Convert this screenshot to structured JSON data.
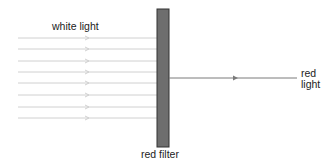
{
  "diagram": {
    "labels": {
      "input": "white light",
      "filter": "red filter",
      "output_line1": "red",
      "output_line2": "light"
    },
    "input_rays": {
      "count": 8,
      "y": [
        38,
        49,
        61,
        72,
        83,
        95,
        107,
        118
      ],
      "x_start": 18,
      "x_end": 157,
      "arrow_x": 88,
      "color": "#d0d0d0"
    },
    "filter": {
      "x": 157,
      "y": 9,
      "width": 12,
      "height": 138,
      "fill": "#6e6e6e",
      "stroke": "#333333"
    },
    "output_ray": {
      "y": 78,
      "x_start": 169,
      "x_end": 297,
      "arrow_x": 237,
      "color": "#7a7a7a"
    }
  }
}
